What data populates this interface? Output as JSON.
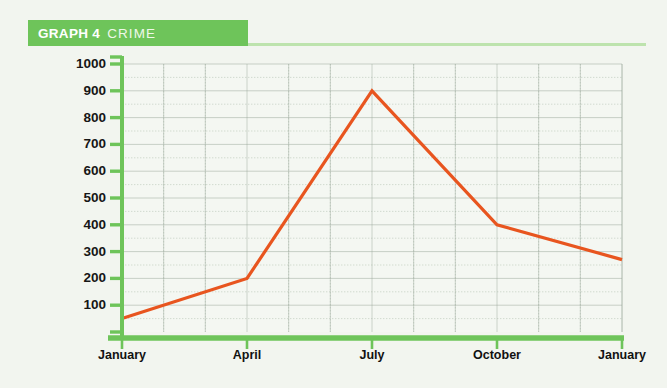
{
  "header": {
    "label_strong": "GRAPH 4",
    "label_light": "CRIME",
    "band_color": "#6EC45A",
    "rule_color": "#BDE3AD"
  },
  "colors": {
    "background": "#F2F5EF",
    "axis_green": "#6EC45A",
    "line_orange": "#E8551F",
    "grid_major": "#9AA79A",
    "grid_minor": "#C3CEC2",
    "tick_text": "#161616"
  },
  "chart_data": {
    "type": "line",
    "title": "GRAPH 4 CRIME",
    "xlabel": "",
    "ylabel": "",
    "categories": [
      "January",
      "April",
      "July",
      "October",
      "January"
    ],
    "x": [
      0,
      1,
      2,
      3,
      4
    ],
    "values": [
      50,
      200,
      900,
      400,
      270
    ],
    "series": [
      {
        "name": "Crime",
        "values": [
          50,
          200,
          900,
          400,
          270
        ],
        "color": "#E8551F"
      }
    ],
    "ylim": [
      0,
      1000
    ],
    "ytick_labels": [
      "1000",
      "900",
      "800",
      "700",
      "600",
      "500",
      "400",
      "300",
      "200",
      "100"
    ],
    "yticks": [
      1000,
      900,
      800,
      700,
      600,
      500,
      400,
      300,
      200,
      100
    ],
    "xtick_labels": [
      "January",
      "April",
      "July",
      "October",
      "January"
    ],
    "grid": true,
    "grid_minor": true,
    "legend": "none"
  }
}
